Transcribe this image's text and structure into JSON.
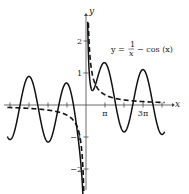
{
  "chart_data": {
    "type": "line",
    "title_parts": {
      "lhs": "y =",
      "num": "1",
      "den": "x",
      "rhs": "− cos (x)"
    },
    "xlabel": "x",
    "ylabel": "y",
    "xlim": [
      -13.5,
      13.5
    ],
    "ylim": [
      -3.0,
      2.5
    ],
    "grid": false,
    "x_ticks": [
      {
        "value": -12.566,
        "label": ""
      },
      {
        "value": -9.425,
        "label": ""
      },
      {
        "value": -6.283,
        "label": ""
      },
      {
        "value": -3.1416,
        "label": ""
      },
      {
        "value": 3.1416,
        "label": "π"
      },
      {
        "value": 6.283,
        "label": ""
      },
      {
        "value": 9.425,
        "label": "3π"
      },
      {
        "value": 12.566,
        "label": ""
      }
    ],
    "y_ticks": [
      {
        "value": 2,
        "label": "2"
      },
      {
        "value": 1,
        "label": "1"
      },
      {
        "value": -1,
        "label": "−1"
      },
      {
        "value": -2,
        "label": "−2"
      }
    ],
    "series": [
      {
        "name": "y = 1/x − cos(x)",
        "style": "solid",
        "expression": "1/x - cos(x)"
      },
      {
        "name": "y = 1/x",
        "style": "dashed",
        "expression": "1/x"
      }
    ]
  }
}
